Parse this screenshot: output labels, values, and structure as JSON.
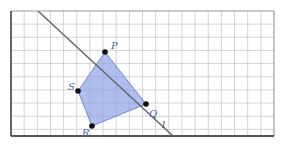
{
  "diagram": {
    "grid": {
      "x0": 11,
      "y0": 11,
      "cell": 13.15,
      "cols": 20,
      "rows": 9.5,
      "x1": 274,
      "y1": 136,
      "grid_color": "#c8c8c8",
      "border_color": "#555555"
    },
    "polygon": {
      "fill": "#8da2e6",
      "fill_opacity": 0.7,
      "stroke": "#5a74c8",
      "vertices": [
        {
          "name": "P",
          "x": 105,
          "y": 52,
          "label": "P",
          "lx": 111,
          "ly": 49
        },
        {
          "name": "Q",
          "x": 146,
          "y": 104,
          "label": "Q",
          "lx": 149,
          "ly": 117
        },
        {
          "name": "R",
          "x": 92,
          "y": 126,
          "label": "R",
          "lx": 82,
          "ly": 136
        },
        {
          "name": "S",
          "x": 78,
          "y": 91,
          "label": "S",
          "lx": 68,
          "ly": 90
        }
      ]
    },
    "line": {
      "label": "l",
      "x1": 38,
      "y1": 11,
      "x2": 173,
      "y2": 136,
      "lx": 162,
      "ly": 128,
      "color": "#6a6a6a"
    },
    "label_color": "#4a63b0"
  }
}
